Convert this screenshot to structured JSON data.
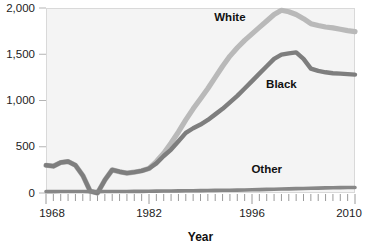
{
  "chart_data": {
    "type": "line",
    "title": "",
    "subtitle": "",
    "xlabel": "Year",
    "ylabel": "",
    "xlim": [
      1968,
      2010
    ],
    "ylim": [
      0,
      2000
    ],
    "grid": false,
    "legend_position": "inline-annotations",
    "x_tick_labels": [
      "1968",
      "1982",
      "1996",
      "2010"
    ],
    "x_tick_values": [
      1968,
      1982,
      1996,
      2010
    ],
    "x_minor_tick_interval": 1,
    "y_tick_labels": [
      "0",
      "500",
      "1,000",
      "1,500",
      "2,000"
    ],
    "y_tick_values": [
      0,
      500,
      1000,
      1500,
      2000
    ],
    "x": [
      1968,
      1969,
      1970,
      1971,
      1972,
      1973,
      1974,
      1975,
      1976,
      1977,
      1978,
      1979,
      1980,
      1981,
      1982,
      1983,
      1984,
      1985,
      1986,
      1987,
      1988,
      1989,
      1990,
      1991,
      1992,
      1993,
      1994,
      1995,
      1996,
      1997,
      1998,
      1999,
      2000,
      2001,
      2002,
      2003,
      2004,
      2005,
      2006,
      2007,
      2008,
      2009,
      2010
    ],
    "series": [
      {
        "name": "White",
        "color": "#b9b9b9",
        "label_x": 1993,
        "label_y": 1860,
        "values": [
          300,
          290,
          330,
          340,
          300,
          190,
          20,
          0,
          140,
          250,
          230,
          215,
          225,
          240,
          265,
          340,
          430,
          540,
          660,
          790,
          910,
          1020,
          1130,
          1250,
          1370,
          1480,
          1570,
          1650,
          1720,
          1790,
          1860,
          1930,
          1975,
          1960,
          1930,
          1885,
          1830,
          1810,
          1795,
          1785,
          1770,
          1755,
          1745
        ]
      },
      {
        "name": "Black",
        "color": "#7e7e7e",
        "label_x": 2000,
        "label_y": 1130,
        "values": [
          300,
          290,
          330,
          340,
          300,
          190,
          20,
          0,
          140,
          250,
          230,
          215,
          225,
          240,
          265,
          320,
          400,
          470,
          560,
          650,
          700,
          740,
          790,
          850,
          910,
          980,
          1050,
          1130,
          1210,
          1290,
          1370,
          1450,
          1495,
          1510,
          1520,
          1450,
          1345,
          1320,
          1305,
          1295,
          1290,
          1285,
          1280
        ]
      },
      {
        "name": "Other",
        "color": "#878787",
        "label_x": 1998,
        "label_y": 215,
        "values": [
          15,
          15,
          16,
          16,
          16,
          16,
          15,
          15,
          16,
          17,
          17,
          17,
          18,
          18,
          19,
          20,
          21,
          22,
          23,
          24,
          25,
          26,
          27,
          28,
          29,
          30,
          31,
          33,
          35,
          37,
          39,
          41,
          43,
          45,
          47,
          49,
          51,
          53,
          55,
          57,
          58,
          59,
          60
        ]
      }
    ]
  },
  "plot": {
    "background_color": "#f4f4f4",
    "frame_color": "#d9d9d9",
    "axis_text_color": "#1c1c1c"
  }
}
